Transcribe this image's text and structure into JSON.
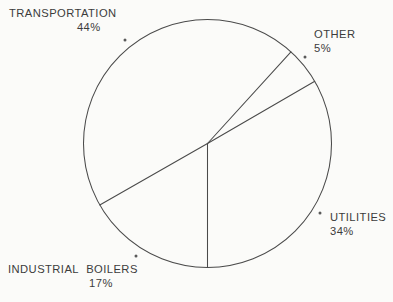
{
  "chart_data": {
    "type": "pie",
    "title": "",
    "subtitle": "",
    "xlabel": "",
    "ylabel": "",
    "legend_position": "none",
    "grid": false,
    "unit": "%",
    "categories": [
      "TRANSPORTATION",
      "OTHER",
      "UTILITIES",
      "INDUSTRIAL  BOILERS"
    ],
    "values": [
      44,
      17,
      34,
      5
    ],
    "slices": [
      {
        "label": "TRANSPORTATION",
        "value": 44,
        "value_text": "44%",
        "start_angle_deg": 150.3,
        "end_angle_deg": 312.3,
        "sweep_deg": 162.0
      },
      {
        "label": "OTHER",
        "value": 5,
        "value_text": "5%",
        "start_angle_deg": 312.3,
        "end_angle_deg": 329.9,
        "sweep_deg": 17.6
      },
      {
        "label": "UTILITIES",
        "value": 34,
        "value_text": "34%",
        "start_angle_deg": 329.9,
        "end_angle_deg": 90.0,
        "sweep_deg": 120.1
      },
      {
        "label": "INDUSTRIAL  BOILERS",
        "value": 17,
        "value_text": "17%",
        "start_angle_deg": 90.0,
        "end_angle_deg": 150.3,
        "sweep_deg": 60.3
      }
    ]
  },
  "labels": {
    "transportation": {
      "name": "TRANSPORTATION",
      "pct": "44%"
    },
    "other": {
      "name": "OTHER",
      "pct": "5%"
    },
    "utilities": {
      "name": "UTILITIES",
      "pct": "34%"
    },
    "industrial_boilers": {
      "name": "INDUSTRIAL  BOILERS",
      "pct": "17%"
    }
  },
  "colors": {
    "background": "#fbfbf9",
    "stroke": "#4a4a4a",
    "text": "#3c3c3c",
    "marker": "#5a5a5a"
  },
  "geometry": {
    "center_x": 207.5,
    "center_y": 143.5,
    "radius": 124
  }
}
